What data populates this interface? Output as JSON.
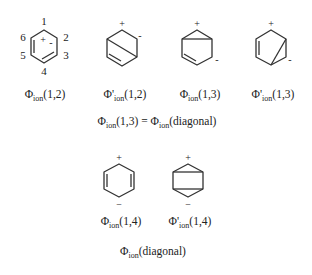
{
  "diagram": {
    "structures": [
      {
        "id": "phi_ion_1_2",
        "label": {
          "prefix": "Φ",
          "prime": "",
          "sub": "ion",
          "args": "(1,2)"
        },
        "atom_numbers": [
          "1",
          "2",
          "3",
          "4",
          "5",
          "6"
        ],
        "charges": {
          "plus": "+",
          "minus": "-"
        }
      },
      {
        "id": "phi_prime_ion_1_2",
        "label": {
          "prefix": "Φ",
          "prime": "'",
          "sub": "ion",
          "args": "(1,2)"
        },
        "charges": {
          "plus": "+",
          "minus": "-"
        }
      },
      {
        "id": "phi_ion_1_3",
        "label": {
          "prefix": "Φ",
          "prime": "",
          "sub": "ion",
          "args": "(1,3)"
        },
        "charges": {
          "plus": "+",
          "minus": "-"
        }
      },
      {
        "id": "phi_prime_ion_1_3",
        "label": {
          "prefix": "Φ",
          "prime": "'",
          "sub": "ion",
          "args": "(1,3)"
        },
        "charges": {
          "plus": "+",
          "minus": "-"
        }
      },
      {
        "id": "phi_ion_1_4",
        "label": {
          "prefix": "Φ",
          "prime": "",
          "sub": "ion",
          "args": "(1,4)"
        },
        "charges": {
          "plus": "+",
          "minus": "−"
        }
      },
      {
        "id": "phi_prime_ion_1_4",
        "label": {
          "prefix": "Φ",
          "prime": "'",
          "sub": "ion",
          "args": "(1,4)"
        },
        "charges": {
          "plus": "+",
          "minus": "−"
        }
      }
    ],
    "equation": {
      "lhs": {
        "prefix": "Φ",
        "sub": "ion",
        "args": "(1,3)"
      },
      "op": " = ",
      "rhs": {
        "prefix": "Φ",
        "sub": "ion",
        "args": "(diagonal)"
      }
    },
    "caption": {
      "prefix": "Φ",
      "sub": "ion",
      "args": "(diagonal)"
    },
    "colors": {
      "stroke": "#333333",
      "text": "#222222",
      "background": "#ffffff"
    }
  }
}
